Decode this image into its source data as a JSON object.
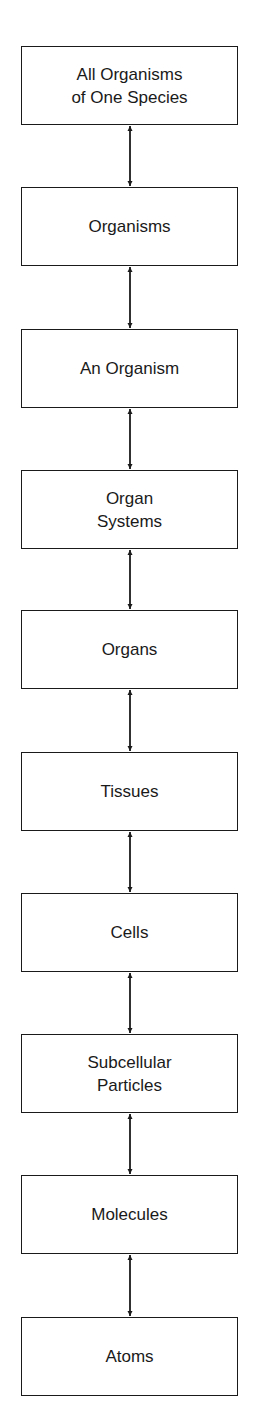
{
  "diagram": {
    "type": "vertical-hierarchy",
    "connector": "double-headed-arrow",
    "levels": [
      {
        "label": "All Organisms\nof One Species"
      },
      {
        "label": "Organisms"
      },
      {
        "label": "An Organism"
      },
      {
        "label": "Organ\nSystems"
      },
      {
        "label": "Organs"
      },
      {
        "label": "Tissues"
      },
      {
        "label": "Cells"
      },
      {
        "label": "Subcellular\nParticles"
      },
      {
        "label": "Molecules"
      },
      {
        "label": "Atoms"
      }
    ],
    "colors": {
      "stroke": "#1a1a1a",
      "background": "#ffffff"
    }
  }
}
